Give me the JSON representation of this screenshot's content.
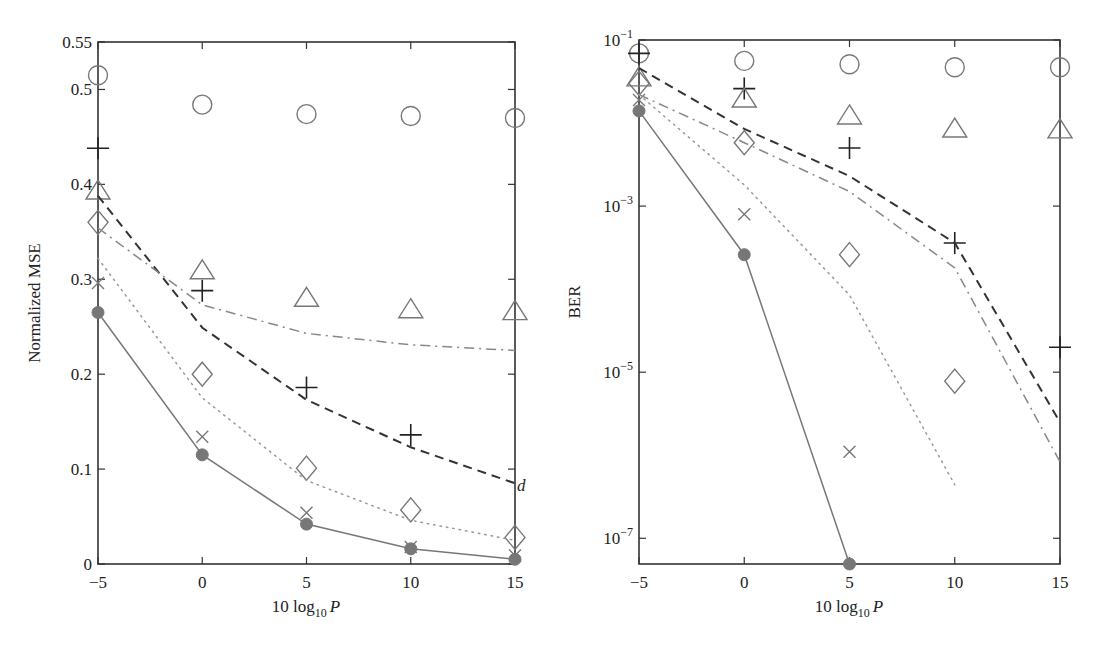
{
  "chart_data": [
    {
      "type": "line",
      "title": "",
      "xlabel": "10 log10 P",
      "xlabel_parts": {
        "main": "10 log",
        "sub": "10",
        "var": "P"
      },
      "ylabel": "Normalized MSE",
      "yscale": "linear",
      "xlim": [
        -5,
        15
      ],
      "ylim": [
        0,
        0.55
      ],
      "xticks": [
        -5,
        0,
        5,
        10,
        15
      ],
      "xtick_labels": [
        "−5",
        "0",
        "5",
        "10",
        "15"
      ],
      "yticks": [
        0,
        0.1,
        0.2,
        0.3,
        0.4,
        0.5,
        0.55
      ],
      "ytick_labels": [
        "0",
        "0.1",
        "0.2",
        "0.3",
        "0.4",
        "0.5",
        "0.55"
      ],
      "grid": false,
      "annotations": [
        {
          "text": "d",
          "x": 15,
          "y": 0.083
        }
      ],
      "x": [
        -5,
        0,
        5,
        10,
        15
      ],
      "series": [
        {
          "name": "circle-markers",
          "style": "markers",
          "marker": "circle",
          "color": "#777777",
          "values": [
            0.515,
            0.484,
            0.474,
            0.472,
            0.47
          ]
        },
        {
          "name": "plus-markers",
          "style": "markers",
          "marker": "plus",
          "color": "#222222",
          "values": [
            0.438,
            0.288,
            0.186,
            0.136,
            null
          ]
        },
        {
          "name": "triangle-markers",
          "style": "markers",
          "marker": "triangle",
          "color": "#777777",
          "values": [
            0.394,
            0.31,
            0.281,
            0.269,
            0.267
          ]
        },
        {
          "name": "diamond-markers",
          "style": "markers",
          "marker": "diamond",
          "color": "#777777",
          "values": [
            0.36,
            0.2,
            0.101,
            0.057,
            0.028
          ]
        },
        {
          "name": "x-markers",
          "style": "markers",
          "marker": "x",
          "color": "#777777",
          "values": [
            0.296,
            0.134,
            0.054,
            0.018,
            0.009
          ]
        },
        {
          "name": "dashed-line",
          "style": "dashed",
          "marker": "none",
          "color": "#333333",
          "values": [
            0.388,
            0.249,
            0.173,
            0.123,
            0.085
          ]
        },
        {
          "name": "dashdot-line",
          "style": "dashdot",
          "marker": "none",
          "color": "#888888",
          "values": [
            0.354,
            0.273,
            0.243,
            0.231,
            0.225
          ]
        },
        {
          "name": "dotted-line",
          "style": "dotted",
          "marker": "none",
          "color": "#999999",
          "values": [
            0.322,
            0.175,
            0.088,
            0.046,
            0.025
          ]
        },
        {
          "name": "solid-filled-circle",
          "style": "solid",
          "marker": "filled-circle",
          "color": "#777777",
          "values": [
            0.265,
            0.115,
            0.042,
            0.016,
            0.005
          ]
        }
      ]
    },
    {
      "type": "line",
      "title": "",
      "xlabel": "10 log10 P",
      "xlabel_parts": {
        "main": "10 log",
        "sub": "10",
        "var": "P"
      },
      "ylabel": "BER",
      "yscale": "log",
      "xlim": [
        -5,
        15
      ],
      "ylim": [
        4.9e-08,
        0.1
      ],
      "xticks": [
        -5,
        0,
        5,
        10,
        15
      ],
      "xtick_labels": [
        "−5",
        "0",
        "5",
        "10",
        "15"
      ],
      "yticks": [
        0.1,
        0.001,
        1e-05,
        1e-07
      ],
      "ytick_labels": [
        {
          "base": "10",
          "exp": "−1"
        },
        {
          "base": "10",
          "exp": "−3"
        },
        {
          "base": "10",
          "exp": "−5"
        },
        {
          "base": "10",
          "exp": "−7"
        }
      ],
      "grid": false,
      "x": [
        -5,
        0,
        5,
        10,
        15
      ],
      "series": [
        {
          "name": "circle-markers",
          "style": "markers",
          "marker": "circle",
          "color": "#777777",
          "values": [
            0.069,
            0.056,
            0.051,
            0.047,
            0.047
          ]
        },
        {
          "name": "plus-markers",
          "style": "markers",
          "marker": "plus",
          "color": "#222222",
          "values": [
            0.069,
            0.026,
            0.005,
            0.00036,
            2e-05
          ]
        },
        {
          "name": "triangle-markers",
          "style": "markers",
          "marker": "triangle",
          "color": "#777777",
          "values": [
            0.036,
            0.02,
            0.0125,
            0.0087,
            0.0085
          ]
        },
        {
          "name": "diamond-markers",
          "style": "markers",
          "marker": "diamond",
          "color": "#777777",
          "values": [
            0.03,
            0.0058,
            0.00026,
            7.8e-06,
            null
          ]
        },
        {
          "name": "x-markers",
          "style": "markers",
          "marker": "x",
          "color": "#777777",
          "values": [
            0.019,
            0.0008,
            1.1e-06,
            null,
            null
          ]
        },
        {
          "name": "dashed-line",
          "style": "dashed",
          "marker": "none",
          "color": "#333333",
          "values": [
            0.046,
            0.0085,
            0.0023,
            0.00036,
            2.5e-06
          ]
        },
        {
          "name": "dashdot-line",
          "style": "dashdot",
          "marker": "none",
          "color": "#888888",
          "values": [
            0.022,
            0.0058,
            0.0015,
            0.00018,
            8.3e-07
          ]
        },
        {
          "name": "dotted-line",
          "style": "dotted",
          "marker": "none",
          "color": "#999999",
          "values": [
            0.022,
            0.0018,
            8.5e-05,
            4.4e-07,
            null
          ]
        },
        {
          "name": "solid-filled-circle",
          "style": "solid",
          "marker": "filled-circle",
          "color": "#777777",
          "values": [
            0.014,
            0.00026,
            4.9e-08,
            null,
            null
          ]
        }
      ]
    }
  ]
}
